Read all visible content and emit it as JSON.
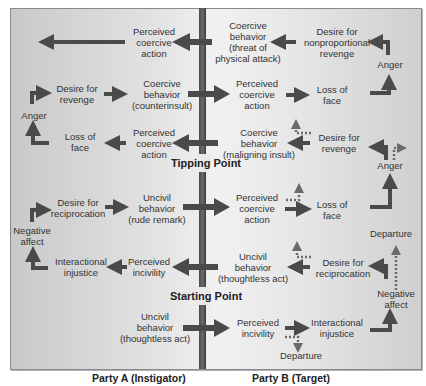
{
  "diagram": {
    "colors": {
      "arrow": "#4a4a4a",
      "dotted_arrow": "#6a6a6a",
      "bar": "#555555",
      "background_edge": "#c9c9c9",
      "background_center": "#f1f1f1"
    },
    "milestones": {
      "tipping_point": "Tipping Point",
      "starting_point": "Starting Point"
    },
    "parties": {
      "a": "Party A (Instigator)",
      "b": "Party B (Target)"
    },
    "party_a": {
      "n1": "Perceived\ncoercive\naction",
      "n2": "Coercive\nbehavior\n(counterinsult)",
      "n3": "Desire for\nrevenge",
      "n4": "Anger",
      "n5": "Loss of\nface",
      "n6": "Perceived\ncoercive\naction",
      "n7": "Uncivil\nbehavior\n(rude remark)",
      "n8": "Desire for\nreciprocation",
      "n9": "Negative\naffect",
      "n10": "Interactional\ninjustice",
      "n11": "Perceived\nincivility",
      "n12": "Uncivil\nbehavior\n(thoughtless act)"
    },
    "party_b": {
      "n1": "Coercive\nbehavior\n(threat of\nphysical attack)",
      "n2": "Desire for\nnonproportional\nrevenge",
      "n3": "Anger",
      "n4": "Perceived\ncoercive\naction",
      "n5": "Loss of\nface",
      "n6": "Coercive\nbehavior\n(maligning insult)",
      "n7": "Desire for\nrevenge",
      "n8": "Anger",
      "n9": "Perceived\ncoercive\naction",
      "n10": "Loss of\nface",
      "n11": "Departure",
      "n12": "Uncivil\nbehavior\n(thoughtless act)",
      "n13": "Desire for\nreciprocation",
      "n14": "Negative\naffect",
      "n15": "Perceived\nincivility",
      "n16": "Interactional\ninjustice",
      "n17": "Departure"
    }
  }
}
